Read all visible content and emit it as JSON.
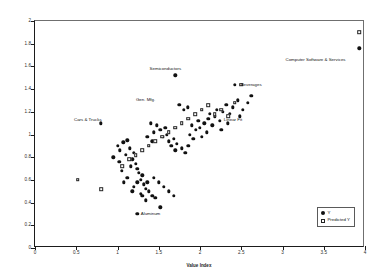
{
  "chart_data": {
    "type": "scatter",
    "title": "",
    "xlabel": "Value Index",
    "ylabel": "Profitability Index Ratio (ROCC/CC)",
    "xlim": [
      0,
      4
    ],
    "ylim": [
      0,
      2
    ],
    "xticks": [
      "0",
      "0.5",
      "1",
      "1.5",
      "2",
      "2.5",
      "3",
      "3.5",
      "4"
    ],
    "yticks": [
      "0",
      "0.2",
      "0.4",
      "0.6",
      "0.8",
      "1",
      "1.2",
      "1.4",
      "1.6",
      "1.8",
      "2"
    ],
    "grid": false,
    "legend_position": "bottom-right",
    "series": [
      {
        "name": "Y",
        "marker": "filled-diamond",
        "points": [
          [
            0.8,
            1.1
          ],
          [
            1.7,
            1.52
          ],
          [
            2.42,
            1.44
          ],
          [
            3.93,
            1.76
          ],
          [
            1.0,
            0.9
          ],
          [
            1.03,
            0.86
          ],
          [
            1.07,
            0.93
          ],
          [
            1.1,
            0.82
          ],
          [
            1.12,
            0.95
          ],
          [
            1.15,
            0.88
          ],
          [
            1.18,
            0.78
          ],
          [
            1.2,
            0.84
          ],
          [
            1.22,
            0.74
          ],
          [
            1.24,
            0.7
          ],
          [
            1.26,
            0.66
          ],
          [
            1.28,
            0.6
          ],
          [
            1.3,
            0.64
          ],
          [
            1.32,
            0.56
          ],
          [
            1.34,
            0.52
          ],
          [
            1.36,
            0.58
          ],
          [
            1.38,
            0.5
          ],
          [
            1.42,
            0.46
          ],
          [
            1.46,
            0.44
          ],
          [
            1.52,
            0.36
          ],
          [
            1.4,
            1.1
          ],
          [
            1.44,
            1.02
          ],
          [
            1.48,
            1.08
          ],
          [
            1.52,
            1.04
          ],
          [
            1.55,
            0.98
          ],
          [
            1.58,
            1.06
          ],
          [
            1.6,
            1.0
          ],
          [
            1.62,
            0.94
          ],
          [
            1.65,
            0.9
          ],
          [
            1.68,
            0.96
          ],
          [
            1.7,
            0.86
          ],
          [
            1.72,
            0.92
          ],
          [
            1.75,
            1.26
          ],
          [
            1.8,
            1.22
          ],
          [
            1.85,
            1.24
          ],
          [
            1.78,
            0.88
          ],
          [
            1.82,
            0.84
          ],
          [
            1.86,
            0.9
          ],
          [
            1.88,
            1.0
          ],
          [
            1.9,
            1.08
          ],
          [
            1.92,
            0.96
          ],
          [
            1.95,
            1.04
          ],
          [
            1.98,
            1.12
          ],
          [
            2.0,
            1.06
          ],
          [
            2.02,
            0.98
          ],
          [
            2.05,
            1.1
          ],
          [
            2.08,
            1.02
          ],
          [
            2.1,
            1.14
          ],
          [
            2.12,
            1.18
          ],
          [
            2.15,
            1.08
          ],
          [
            2.18,
            1.16
          ],
          [
            2.2,
            1.22
          ],
          [
            2.24,
            1.12
          ],
          [
            2.28,
            1.2
          ],
          [
            2.32,
            1.26
          ],
          [
            2.36,
            1.18
          ],
          [
            2.4,
            1.24
          ],
          [
            2.46,
            1.3
          ],
          [
            2.52,
            1.22
          ],
          [
            2.58,
            1.28
          ],
          [
            1.05,
            0.68
          ],
          [
            1.12,
            0.62
          ],
          [
            1.2,
            0.54
          ],
          [
            1.28,
            0.48
          ],
          [
            1.34,
            0.42
          ],
          [
            1.16,
            0.72
          ],
          [
            1.24,
            0.58
          ],
          [
            1.08,
            0.58
          ],
          [
            1.18,
            0.5
          ],
          [
            1.3,
            0.46
          ],
          [
            1.24,
            0.3
          ],
          [
            1.44,
            0.62
          ],
          [
            1.5,
            0.58
          ],
          [
            1.56,
            0.54
          ],
          [
            1.62,
            0.5
          ],
          [
            1.68,
            0.46
          ],
          [
            0.95,
            0.8
          ],
          [
            1.02,
            0.76
          ],
          [
            1.36,
            0.98
          ],
          [
            1.42,
            0.94
          ],
          [
            2.26,
            1.04
          ],
          [
            2.34,
            1.1
          ],
          [
            2.48,
            1.16
          ],
          [
            2.62,
            1.34
          ]
        ]
      },
      {
        "name": "Predicted Y",
        "marker": "open-square",
        "points": [
          [
            0.52,
            0.6
          ],
          [
            0.8,
            0.52
          ],
          [
            1.06,
            0.72
          ],
          [
            1.14,
            0.78
          ],
          [
            1.22,
            0.82
          ],
          [
            1.3,
            0.86
          ],
          [
            1.38,
            0.9
          ],
          [
            1.46,
            0.94
          ],
          [
            1.54,
            0.98
          ],
          [
            1.62,
            1.02
          ],
          [
            1.7,
            1.06
          ],
          [
            1.78,
            1.1
          ],
          [
            1.86,
            1.14
          ],
          [
            1.94,
            1.18
          ],
          [
            2.02,
            1.22
          ],
          [
            2.1,
            1.26
          ],
          [
            2.18,
            1.18
          ],
          [
            2.26,
            1.22
          ],
          [
            2.34,
            1.16
          ],
          [
            2.42,
            1.28
          ],
          [
            2.5,
            1.44
          ],
          [
            3.93,
            1.9
          ]
        ]
      }
    ],
    "annotations": [
      {
        "label": "Cars & Trucks",
        "x": 0.64,
        "y": 1.13
      },
      {
        "label": "Semiconductors",
        "x": 1.58,
        "y": 1.58
      },
      {
        "label": "Gen. Mfg.",
        "x": 1.34,
        "y": 1.3
      },
      {
        "label": "Beverages",
        "x": 2.62,
        "y": 1.44
      },
      {
        "label": "Linear Fit",
        "x": 2.4,
        "y": 1.13
      },
      {
        "label": "Computer Software & Services",
        "x": 3.4,
        "y": 1.66
      },
      {
        "label": "Aluminum",
        "x": 1.4,
        "y": 0.3
      }
    ],
    "legend": [
      {
        "label": "Y",
        "marker": "filled-diamond"
      },
      {
        "label": "Predicted Y",
        "marker": "open-square"
      }
    ]
  }
}
